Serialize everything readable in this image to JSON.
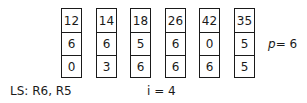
{
  "columns": [
    {
      "values": [
        "12",
        "6",
        "0"
      ]
    },
    {
      "values": [
        "14",
        "6",
        "3"
      ]
    },
    {
      "values": [
        "18",
        "5",
        "6"
      ]
    },
    {
      "values": [
        "26",
        "6",
        "6"
      ]
    },
    {
      "values": [
        "42",
        "0",
        "6"
      ]
    },
    {
      "values": [
        "35",
        "5",
        "5"
      ]
    }
  ],
  "p_label": "p",
  "p_value": "= 6",
  "ls_label": "LS: R6, R5",
  "i_label": "i = 4"
}
